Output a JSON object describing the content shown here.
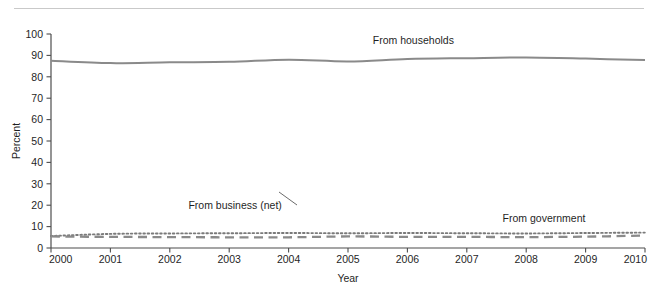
{
  "chart_data": {
    "type": "line",
    "title": "",
    "xlabel": "Year",
    "ylabel": "Percent",
    "xlim": [
      2000,
      2010
    ],
    "ylim": [
      0,
      100
    ],
    "grid": false,
    "legend_position": "inline-annotations",
    "x": [
      2000,
      2001,
      2002,
      2003,
      2004,
      2005,
      2006,
      2007,
      2008,
      2009,
      2010
    ],
    "xticklabels": [
      "2000",
      "2001",
      "2002",
      "2003",
      "2004",
      "2005",
      "2006",
      "2007",
      "2008",
      "2009",
      "2010"
    ],
    "yticklabels": [
      "0",
      "10",
      "20",
      "30",
      "40",
      "50",
      "60",
      "70",
      "80",
      "90",
      "100"
    ],
    "yticks": [
      0,
      10,
      20,
      30,
      40,
      50,
      60,
      70,
      80,
      90,
      100
    ],
    "series": [
      {
        "name": "From households",
        "style": "solid",
        "color": "#8a8a8a",
        "values": [
          87.5,
          86.4,
          86.8,
          87.0,
          88.0,
          87.2,
          88.3,
          88.7,
          89.0,
          88.5,
          87.8
        ]
      },
      {
        "name": "From government",
        "style": "dotted",
        "color": "#7a7a7a",
        "values": [
          5.6,
          6.6,
          6.8,
          6.9,
          7.0,
          6.9,
          7.0,
          6.9,
          6.8,
          7.0,
          7.2
        ]
      },
      {
        "name": "From business (net)",
        "style": "dashed",
        "color": "#8a8a8a",
        "values": [
          5.4,
          5.2,
          5.1,
          5.0,
          5.0,
          5.4,
          5.2,
          5.2,
          5.1,
          5.3,
          5.8
        ]
      }
    ],
    "annotations": [
      {
        "text": "From households",
        "x": 2006.1,
        "y": 95.5
      },
      {
        "text": "From business (net)",
        "x": 2003.1,
        "y": 18.0
      },
      {
        "text": "From government",
        "x": 2008.3,
        "y": 12.2
      }
    ]
  }
}
